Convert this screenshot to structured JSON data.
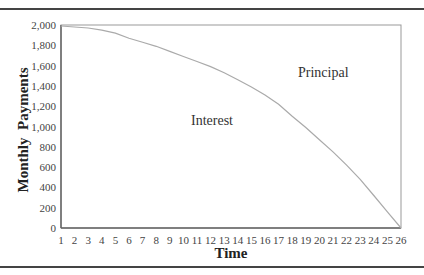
{
  "chart_data": {
    "type": "area",
    "title": "",
    "xlabel": "Time",
    "ylabel": "Monthly  Payments",
    "x": [
      1,
      2,
      3,
      4,
      5,
      6,
      7,
      8,
      9,
      10,
      11,
      12,
      13,
      14,
      15,
      16,
      17,
      18,
      19,
      20,
      21,
      22,
      23,
      24,
      25,
      26
    ],
    "x_tick_labels": [
      "1",
      "2",
      "3",
      "4",
      "5",
      "6",
      "7",
      "8",
      "9",
      "10",
      "11",
      "12",
      "13",
      "14",
      "15",
      "16",
      "17",
      "18",
      "19",
      "20",
      "21",
      "22",
      "23",
      "24",
      "25",
      "26"
    ],
    "y_tick_labels": [
      "0",
      "200",
      "400",
      "600",
      "800",
      "1,000",
      "1,200",
      "1,400",
      "1,600",
      "1,800",
      "2,000"
    ],
    "ylim": [
      0,
      2000
    ],
    "xlim": [
      1,
      26
    ],
    "grid": false,
    "series": [
      {
        "name": "Interest",
        "values": [
          1990,
          1980,
          1970,
          1950,
          1920,
          1870,
          1830,
          1790,
          1740,
          1690,
          1640,
          1590,
          1530,
          1460,
          1390,
          1310,
          1220,
          1100,
          990,
          870,
          750,
          620,
          480,
          320,
          160,
          0
        ]
      },
      {
        "name": "Principal",
        "values": [
          10,
          20,
          30,
          50,
          80,
          130,
          170,
          210,
          260,
          310,
          360,
          410,
          470,
          540,
          610,
          690,
          780,
          900,
          1010,
          1130,
          1250,
          1380,
          1520,
          1680,
          1840,
          2000
        ]
      }
    ],
    "total_payment": 2000,
    "annotations": [
      {
        "text": "Interest",
        "region": "below curve"
      },
      {
        "text": "Principal",
        "region": "above curve"
      }
    ]
  },
  "labels": {
    "interest": "Interest",
    "principal": "Principal",
    "xlabel": "Time",
    "ylabel": "Monthly  Payments"
  }
}
